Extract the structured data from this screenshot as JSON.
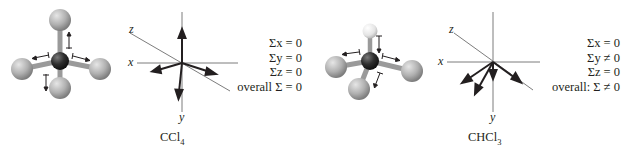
{
  "figures": [
    {
      "molecule": "CCl4",
      "label_main": "CCl",
      "label_sub": "4",
      "axes": {
        "x": "x",
        "y": "y",
        "z": "z"
      },
      "sums": [
        "Σx = 0",
        "Σy = 0",
        "Σz = 0",
        "overall Σ = 0"
      ],
      "atoms": {
        "center": "C",
        "substituents": [
          "Cl",
          "Cl",
          "Cl",
          "Cl"
        ]
      }
    },
    {
      "molecule": "CHCl3",
      "label_main": "CHCl",
      "label_sub": "3",
      "axes": {
        "x": "x",
        "y": "y",
        "z": "z"
      },
      "sums": [
        "Σx = 0",
        "Σy ≠ 0",
        "Σz = 0",
        "overall: Σ ≠ 0"
      ],
      "atoms": {
        "center": "C",
        "substituents": [
          "H",
          "Cl",
          "Cl",
          "Cl"
        ]
      }
    }
  ],
  "colors": {
    "carbon": "#2b2b2b",
    "chlorine": "#b5b5b5",
    "hydrogen": "#eeeeee",
    "bond": "#9a9a9a",
    "ink": "#231f20",
    "axis": "#6d6d6d"
  }
}
